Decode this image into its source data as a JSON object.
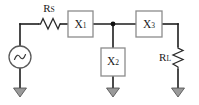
{
  "figure": {
    "type": "circuit-schematic",
    "background_color": "#ffffff",
    "wire_color": "#1d1d1d",
    "box_stroke_color": "#8c8c8c",
    "ground_fill_color": "#9a9a9a"
  },
  "components": {
    "source": {
      "name": "ac-voltage-source",
      "symbol": "sine-in-circle",
      "label": ""
    },
    "series_resistor": {
      "name": "source-resistor",
      "symbol": "zigzag-horizontal",
      "label_main": "R",
      "label_sub": "S"
    },
    "load_resistor": {
      "name": "load-resistor",
      "symbol": "zigzag-vertical",
      "label_main": "R",
      "label_sub": "L"
    },
    "x1": {
      "name": "reactance-x1",
      "symbol": "rectangle-series",
      "label_main": "X",
      "label_sub": "1"
    },
    "x2": {
      "name": "reactance-x2",
      "symbol": "rectangle-shunt",
      "label_main": "X",
      "label_sub": "2"
    },
    "x3": {
      "name": "reactance-x3",
      "symbol": "rectangle-series",
      "label_main": "X",
      "label_sub": "3"
    },
    "junction": {
      "name": "junction-node",
      "symbol": "filled-dot"
    },
    "grounds": [
      {
        "name": "ground-source",
        "symbol": "triangle-ground"
      },
      {
        "name": "ground-x2",
        "symbol": "triangle-ground"
      },
      {
        "name": "ground-load",
        "symbol": "triangle-ground"
      }
    ]
  },
  "geometry": {
    "top_rail_y": 24,
    "bottom_y": 92,
    "source_x": 20,
    "x1_box": {
      "x": 68,
      "y": 11,
      "w": 25,
      "h": 26
    },
    "x2_box": {
      "x": 101,
      "y": 48,
      "w": 24,
      "h": 28
    },
    "x3_box": {
      "x": 136,
      "y": 11,
      "w": 26,
      "h": 26
    },
    "junction_x": 113,
    "load_x": 178
  }
}
